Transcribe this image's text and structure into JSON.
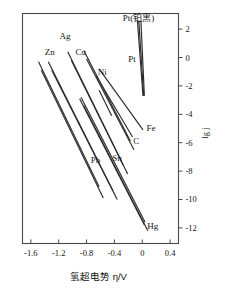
{
  "chart_data": {
    "type": "line",
    "title": "",
    "xlabel": "氢超电势 η/V",
    "ylabel": "lg j",
    "xlim": [
      -1.72,
      0.52
    ],
    "ylim": [
      -13.1,
      3.1
    ],
    "grid": false,
    "legend": "inline-labels",
    "xticks": [
      "-1.6",
      "-1.2",
      "-0.8",
      "-0.4",
      "0",
      "0.4"
    ],
    "xtickvalues": [
      -1.6,
      -1.2,
      -0.8,
      -0.4,
      0,
      0.4
    ],
    "yticks": [
      "2",
      "0",
      "-2",
      "-4",
      "-6",
      "-8",
      "-10",
      "-12"
    ],
    "ytickvalues": [
      2,
      0,
      -2,
      -4,
      -6,
      -8,
      -10,
      -12
    ],
    "series": [
      {
        "name": "Zn",
        "label": "Zn",
        "x": [
          -1.49,
          -0.62
        ],
        "y": [
          -0.3,
          -9.1
        ]
      },
      {
        "name": "Zn2",
        "label": "",
        "x": [
          -1.45,
          -0.56
        ],
        "y": [
          -0.9,
          -9.9
        ]
      },
      {
        "name": "Ag",
        "label": "Ag",
        "x": [
          -1.35,
          -0.42
        ],
        "y": [
          -0.3,
          -9.4
        ]
      },
      {
        "name": "Ag2",
        "label": "",
        "x": [
          -1.3,
          -0.36
        ],
        "y": [
          -0.9,
          -10.0
        ]
      },
      {
        "name": "Cu",
        "label": "Cu",
        "x": [
          -1.07,
          -0.27
        ],
        "y": [
          0.4,
          -7.6
        ]
      },
      {
        "name": "Cu2",
        "label": "",
        "x": [
          -1.02,
          -0.21
        ],
        "y": [
          -0.2,
          -8.2
        ]
      },
      {
        "name": "Ni",
        "label": "Ni",
        "x": [
          -0.84,
          -0.17
        ],
        "y": [
          0.5,
          -5.9
        ]
      },
      {
        "name": "Ni2",
        "label": "",
        "x": [
          -0.8,
          -0.12
        ],
        "y": [
          -0.1,
          -6.5
        ]
      },
      {
        "name": "Ni3",
        "label": "",
        "x": [
          -0.62,
          -0.44
        ],
        "y": [
          -2.3,
          -4.1
        ]
      },
      {
        "name": "Fe",
        "label": "Fe",
        "x": [
          -0.62,
          0.01
        ],
        "y": [
          -0.8,
          -5.1
        ]
      },
      {
        "name": "C",
        "label": "C",
        "x": [
          -0.66,
          -0.14
        ],
        "y": [
          -1.3,
          -5.6
        ]
      },
      {
        "name": "Pt",
        "label": "Pt",
        "x": [
          -0.05,
          0.02
        ],
        "y": [
          2.6,
          -2.7
        ]
      },
      {
        "name": "Pt2",
        "label": "",
        "x": [
          -0.02,
          0.03
        ],
        "y": [
          2.6,
          -2.7
        ]
      },
      {
        "name": "Ptblack",
        "label": "Pt(铂黑)",
        "x": [
          -0.07,
          0.01
        ],
        "y": [
          2.6,
          -2.7
        ]
      },
      {
        "name": "Pb",
        "label": "Pb",
        "x": [
          -0.88,
          0.04
        ],
        "y": [
          -2.8,
          -11.6
        ]
      },
      {
        "name": "Sn",
        "label": "Sn",
        "x": [
          -0.84,
          0.08
        ],
        "y": [
          -3.4,
          -12.2
        ]
      },
      {
        "name": "Hg",
        "label": "Hg",
        "x": [
          -0.9,
          0.03
        ],
        "y": [
          -2.9,
          -11.8
        ]
      }
    ],
    "annotations": [
      {
        "name": "Ag",
        "text": "Ag",
        "x": -1.19,
        "y": 1.3
      },
      {
        "name": "Zn",
        "text": "Zn",
        "x": -1.4,
        "y": 0.2
      },
      {
        "name": "Cu",
        "text": "Cu",
        "x": -0.96,
        "y": 0.2
      },
      {
        "name": "Ni",
        "text": "Ni",
        "x": -0.64,
        "y": -1.2
      },
      {
        "name": "Pt-black",
        "text": "Pt(铂黑)",
        "x": -0.28,
        "y": 2.6
      },
      {
        "name": "Pt",
        "text": "Pt",
        "x": -0.2,
        "y": -0.3
      },
      {
        "name": "Fe",
        "text": "Fe",
        "x": 0.06,
        "y": -5.2
      },
      {
        "name": "C",
        "text": "C",
        "x": -0.13,
        "y": -6.1
      },
      {
        "name": "Sn",
        "text": "Sn",
        "x": -0.43,
        "y": -7.3
      },
      {
        "name": "Pb",
        "text": "Pb",
        "x": -0.74,
        "y": -7.4
      },
      {
        "name": "Hg",
        "text": "Hg",
        "x": 0.07,
        "y": -12.1
      }
    ]
  },
  "axes": {
    "x_title": "氢超电势 η/V",
    "y_title": "lg j",
    "x_tick_labels": [
      "-1.6",
      "-1.2",
      "-0.8",
      "-0.4",
      "0",
      "0.4"
    ],
    "y_tick_labels": [
      "2",
      "0",
      "-2",
      "-4",
      "-6",
      "-8",
      "-10",
      "-12"
    ]
  },
  "colors": {
    "line": "#2b2b2b",
    "axis": "#4a4a4a",
    "text": "#151515",
    "background": "#ffffff"
  }
}
